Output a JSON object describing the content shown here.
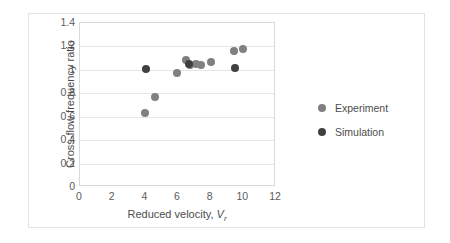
{
  "chart_data": {
    "type": "scatter",
    "title": "",
    "xlabel": "Reduced velocity, V_r",
    "xlabel_parts": {
      "text": "Reduced velocity, ",
      "symbol": "V",
      "subscript": "r"
    },
    "ylabel": "Cross-flow frequency ratio",
    "xlim": [
      0,
      12
    ],
    "ylim": [
      0,
      1.4
    ],
    "xticks": [
      0,
      2,
      4,
      6,
      8,
      10,
      12
    ],
    "xtick_labels": [
      "0",
      "2",
      "4",
      "6",
      "8",
      "10",
      "12"
    ],
    "yticks": [
      0,
      0.2,
      0.4,
      0.6,
      0.8,
      1,
      1.2,
      1.4
    ],
    "ytick_labels": [
      "0",
      "0.2",
      "0.4",
      "0.6",
      "0.8",
      "1",
      "1.2",
      "1.4"
    ],
    "grid": "horizontal",
    "legend_position": "right",
    "marker": "circle",
    "series": [
      {
        "name": "Experiment",
        "color": "#808080",
        "points": [
          {
            "x": 4.0,
            "y": 0.63
          },
          {
            "x": 4.6,
            "y": 0.77
          },
          {
            "x": 5.95,
            "y": 0.97
          },
          {
            "x": 6.5,
            "y": 1.08
          },
          {
            "x": 6.75,
            "y": 1.04
          },
          {
            "x": 7.1,
            "y": 1.05
          },
          {
            "x": 7.4,
            "y": 1.04
          },
          {
            "x": 8.0,
            "y": 1.07
          },
          {
            "x": 9.4,
            "y": 1.16
          },
          {
            "x": 10.0,
            "y": 1.18
          }
        ]
      },
      {
        "name": "Simulation",
        "color": "#404040",
        "points": [
          {
            "x": 4.05,
            "y": 1.01
          },
          {
            "x": 6.65,
            "y": 1.05
          },
          {
            "x": 9.5,
            "y": 1.02
          }
        ]
      }
    ]
  },
  "legend": {
    "entries": [
      {
        "label": "Experiment",
        "series_key": "experiment"
      },
      {
        "label": "Simulation",
        "series_key": "simulation"
      }
    ]
  }
}
